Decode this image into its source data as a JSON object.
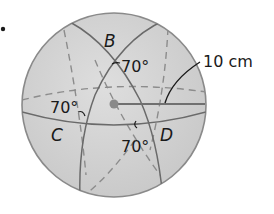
{
  "figure": {
    "bullet": "•",
    "points": {
      "B": "B",
      "C": "C",
      "D": "D"
    },
    "angles": {
      "at_B": "70°",
      "at_C": "70°",
      "at_D": "70°"
    },
    "radius_label": "10 cm",
    "colors": {
      "sphere_fill": "#d3d3d3",
      "sphere_edge": "#8a8a8a",
      "great_circle": "#6a6a6a",
      "dashed": "#8c8c8c",
      "center": "#8a8a8a",
      "text": "#1a1a1a"
    }
  }
}
